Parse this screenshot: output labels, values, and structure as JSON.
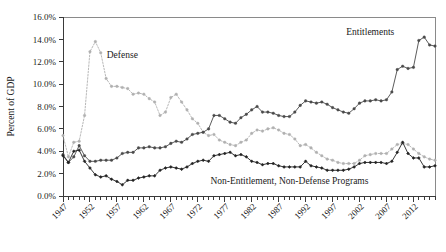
{
  "chart_data": {
    "type": "line",
    "title": "",
    "subtitle": "",
    "xlabel": "",
    "ylabel": "Percent of GDP",
    "xlim": [
      1947,
      2016
    ],
    "ylim": [
      0,
      16
    ],
    "y_tick_labels": [
      "0.0%",
      "2.0%",
      "4.0%",
      "6.0%",
      "8.0%",
      "10.0%",
      "12.0%",
      "14.0%",
      "16.0%"
    ],
    "y_tick_values": [
      0,
      2,
      4,
      6,
      8,
      10,
      12,
      14,
      16
    ],
    "x_tick_labels": [
      "1947",
      "1952",
      "1957",
      "1962",
      "1967",
      "1972",
      "1977",
      "1982",
      "1987",
      "1992",
      "1997",
      "2002",
      "2007",
      "2012"
    ],
    "x_tick_values": [
      1947,
      1952,
      1957,
      1962,
      1967,
      1972,
      1977,
      1982,
      1987,
      1992,
      1997,
      2002,
      2007,
      2012
    ],
    "x_minor_tick_step": 1,
    "grid": false,
    "legend_position": "inline-annotations",
    "annotations": [
      {
        "text": "Defense",
        "x": 1958,
        "y": 12.3
      },
      {
        "text": "Entitlements",
        "x": 2004,
        "y": 14.4
      },
      {
        "text": "Non-Entitlement, Non-Defense Programs",
        "x": 1989,
        "y": 1.05
      }
    ],
    "x": [
      1947,
      1948,
      1949,
      1950,
      1951,
      1952,
      1953,
      1954,
      1955,
      1956,
      1957,
      1958,
      1959,
      1960,
      1961,
      1962,
      1963,
      1964,
      1965,
      1966,
      1967,
      1968,
      1969,
      1970,
      1971,
      1972,
      1973,
      1974,
      1975,
      1976,
      1977,
      1978,
      1979,
      1980,
      1981,
      1982,
      1983,
      1984,
      1985,
      1986,
      1987,
      1988,
      1989,
      1990,
      1991,
      1992,
      1993,
      1994,
      1995,
      1996,
      1997,
      1998,
      1999,
      2000,
      2001,
      2002,
      2003,
      2004,
      2005,
      2006,
      2007,
      2008,
      2009,
      2010,
      2011,
      2012,
      2013,
      2014,
      2015,
      2016
    ],
    "series": [
      {
        "name": "Defense",
        "color": "#b0b0b0",
        "marker": "circle",
        "linestyle": "dotted",
        "values": [
          5.4,
          3.5,
          4.8,
          4.9,
          7.2,
          12.9,
          13.8,
          12.8,
          10.5,
          9.8,
          9.8,
          9.7,
          9.6,
          9.1,
          9.2,
          9.1,
          8.7,
          8.4,
          7.2,
          7.5,
          8.8,
          9.1,
          8.4,
          7.7,
          6.9,
          6.5,
          5.7,
          5.4,
          5.5,
          5.0,
          4.8,
          4.6,
          4.5,
          4.8,
          5.0,
          5.6,
          5.9,
          5.8,
          6.0,
          6.1,
          5.9,
          5.6,
          5.5,
          5.1,
          4.5,
          4.6,
          4.3,
          3.9,
          3.6,
          3.3,
          3.2,
          3.0,
          2.9,
          2.9,
          2.9,
          3.2,
          3.6,
          3.7,
          3.8,
          3.8,
          3.8,
          4.2,
          4.6,
          4.7,
          4.6,
          4.2,
          3.8,
          3.5,
          3.3,
          3.2
        ]
      },
      {
        "name": "Entitlements",
        "color": "#4a4a4a",
        "marker": "circle",
        "linestyle": "solid",
        "values": [
          3.7,
          3.0,
          3.5,
          4.5,
          3.6,
          3.1,
          3.1,
          3.2,
          3.2,
          3.2,
          3.4,
          3.8,
          3.9,
          3.9,
          4.3,
          4.3,
          4.4,
          4.3,
          4.3,
          4.4,
          4.7,
          4.9,
          4.8,
          5.1,
          5.5,
          5.6,
          5.7,
          6.0,
          7.2,
          7.2,
          6.9,
          6.6,
          6.5,
          7.0,
          7.3,
          7.7,
          8.0,
          7.5,
          7.5,
          7.4,
          7.2,
          7.1,
          7.1,
          7.5,
          8.1,
          8.5,
          8.4,
          8.3,
          8.4,
          8.2,
          7.9,
          7.7,
          7.5,
          7.4,
          7.8,
          8.3,
          8.5,
          8.5,
          8.6,
          8.5,
          8.6,
          9.3,
          11.3,
          11.6,
          11.4,
          11.5,
          13.9,
          14.2,
          13.5,
          13.4
        ]
      },
      {
        "name": "Non-Entitlement, Non-Defense Programs",
        "color": "#222222",
        "marker": "diamond",
        "linestyle": "solid",
        "values": [
          3.6,
          3.0,
          4.0,
          4.1,
          3.1,
          2.5,
          1.9,
          1.7,
          1.8,
          1.5,
          1.3,
          1.0,
          1.4,
          1.4,
          1.6,
          1.7,
          1.8,
          1.8,
          2.3,
          2.5,
          2.6,
          2.5,
          2.4,
          2.6,
          2.9,
          3.1,
          3.2,
          3.1,
          3.6,
          3.7,
          3.8,
          3.9,
          3.6,
          3.7,
          3.5,
          3.1,
          3.0,
          2.8,
          2.9,
          2.9,
          2.7,
          2.6,
          2.6,
          2.6,
          2.6,
          3.1,
          2.7,
          2.6,
          2.5,
          2.3,
          2.3,
          2.3,
          2.3,
          2.4,
          2.6,
          2.9,
          3.0,
          3.0,
          3.0,
          3.0,
          2.9,
          3.1,
          3.9,
          4.8,
          3.8,
          3.4,
          3.4,
          2.6,
          2.6,
          2.7
        ]
      }
    ]
  }
}
